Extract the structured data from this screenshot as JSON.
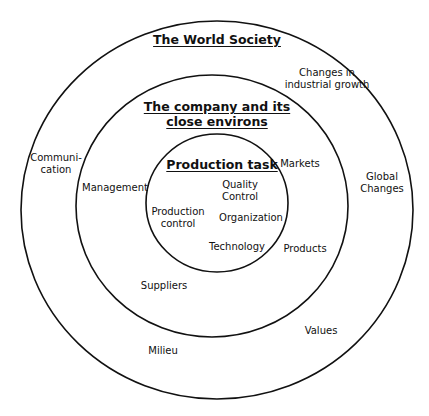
{
  "diagram": {
    "type": "concentric-circles",
    "colors": {
      "stroke": "#111111",
      "background": "#ffffff",
      "text": "#111111"
    },
    "circles": [
      {
        "id": "outer",
        "title": "The World Society",
        "labels": [
          "Changes in\nindustrial growth",
          "Communi-\ncation",
          "Global\nChanges",
          "Values",
          "Milieu"
        ]
      },
      {
        "id": "middle",
        "title": "The company and its\nclose environs",
        "labels": [
          "Management",
          "Markets",
          "Products",
          "Suppliers"
        ]
      },
      {
        "id": "inner",
        "title": "Production task",
        "labels": [
          "Quality\nControl",
          "Production\ncontrol",
          "Organization",
          "Technology"
        ]
      }
    ]
  }
}
